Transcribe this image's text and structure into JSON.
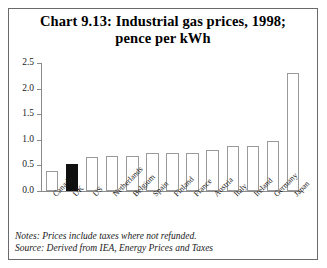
{
  "title": {
    "line1": "Chart 9.13: Industrial gas prices, 1998;",
    "line2": "pence per kWh"
  },
  "footnotes": {
    "notes": "Notes: Prices include taxes where not refunded.",
    "source": "Source: Derived from IEA, Energy Prices and Taxes"
  },
  "colors": {
    "bar_fill": "#ffffff",
    "bar_edge": "#9a9a9a",
    "highlight_fill": "#101010",
    "axis": "#8a8a8a",
    "frame": "#6a6a6a",
    "text": "#000000"
  },
  "chart_data": {
    "type": "bar",
    "title": "Chart 9.13: Industrial gas prices, 1998; pence per kWh",
    "xlabel": "",
    "ylabel": "",
    "ylim": [
      0,
      2.5
    ],
    "yticks": [
      "0.0",
      "0.5",
      "1.0",
      "1.5",
      "2.0",
      "2.5"
    ],
    "ytick_values": [
      0.0,
      0.5,
      1.0,
      1.5,
      2.0,
      2.5
    ],
    "grid": false,
    "legend": "none",
    "highlight_category": "UK",
    "categories": [
      "Canada",
      "UK",
      "US",
      "Netherlands",
      "Belgium",
      "Spain",
      "Finland",
      "France",
      "Austria",
      "Italy",
      "Ireland",
      "Germany",
      "Japan"
    ],
    "values": [
      0.39,
      0.53,
      0.66,
      0.68,
      0.69,
      0.74,
      0.74,
      0.75,
      0.8,
      0.88,
      0.88,
      0.98,
      2.3
    ]
  }
}
